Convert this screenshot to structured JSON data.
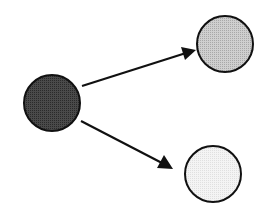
{
  "diagram": {
    "type": "directed-graph",
    "nodes": [
      {
        "id": "source",
        "cx": 52,
        "cy": 103,
        "r": 28,
        "fill": "#3a3a3a",
        "stroke": "#111111"
      },
      {
        "id": "target-top",
        "cx": 225,
        "cy": 44,
        "r": 28,
        "fill": "#bdbdbd",
        "stroke": "#111111"
      },
      {
        "id": "target-bottom",
        "cx": 213,
        "cy": 174,
        "r": 28,
        "fill": "#ececec",
        "stroke": "#111111"
      }
    ],
    "edges": [
      {
        "from": "source",
        "to": "target-top",
        "x1": 82,
        "y1": 86,
        "x2": 196,
        "y2": 50
      },
      {
        "from": "source",
        "to": "target-bottom",
        "x1": 81,
        "y1": 121,
        "x2": 172,
        "y2": 168
      }
    ],
    "colors": {
      "line": "#111111",
      "background": "#ffffff"
    }
  }
}
